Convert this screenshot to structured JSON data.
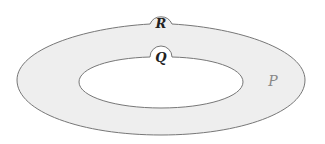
{
  "diagram": {
    "type": "nested-regions",
    "fill_color": "#eeeeee",
    "stroke_color": "#777777",
    "regions": [
      {
        "id": "P",
        "label": "P",
        "description": "outer ring region"
      },
      {
        "id": "Q",
        "label": "Q",
        "description": "bump on inner boundary"
      },
      {
        "id": "R",
        "label": "R",
        "description": "bump on outer boundary"
      }
    ]
  }
}
